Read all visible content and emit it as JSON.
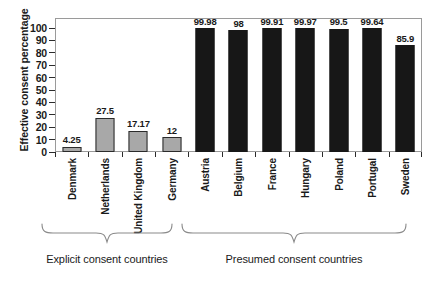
{
  "chart_data": {
    "type": "bar",
    "title": "",
    "xlabel": "",
    "ylabel": "Effective consent percentage",
    "ylim": [
      0,
      100
    ],
    "yticks": [
      0,
      10,
      20,
      30,
      40,
      50,
      60,
      70,
      80,
      90,
      100
    ],
    "grid": false,
    "legend": "none",
    "categories": [
      "Denmark",
      "Netherlands",
      "United Kingdom",
      "Germany",
      "Austria",
      "Belgium",
      "France",
      "Hungary",
      "Poland",
      "Portugal",
      "Sweden"
    ],
    "values": [
      4.25,
      27.5,
      17.17,
      12,
      99.98,
      98,
      99.91,
      99.97,
      99.5,
      99.64,
      85.9
    ],
    "value_labels": [
      "4.25",
      "27.5",
      "17.17",
      "12",
      "99.98",
      "98",
      "99.91",
      "99.97",
      "99.5",
      "99.64",
      "85.9"
    ],
    "bars": [
      {
        "category": "Denmark",
        "value": 4.25,
        "label": "4.25",
        "group": "explicit",
        "color": "#a8a8a8"
      },
      {
        "category": "Netherlands",
        "value": 27.5,
        "label": "27.5",
        "group": "explicit",
        "color": "#a8a8a8"
      },
      {
        "category": "United Kingdom",
        "value": 17.17,
        "label": "17.17",
        "group": "explicit",
        "color": "#a8a8a8"
      },
      {
        "category": "Germany",
        "value": 12,
        "label": "12",
        "group": "explicit",
        "color": "#a8a8a8"
      },
      {
        "category": "Austria",
        "value": 99.98,
        "label": "99.98",
        "group": "presumed",
        "color": "#171717"
      },
      {
        "category": "Belgium",
        "value": 98,
        "label": "98",
        "group": "presumed",
        "color": "#171717"
      },
      {
        "category": "France",
        "value": 99.91,
        "label": "99.91",
        "group": "presumed",
        "color": "#171717"
      },
      {
        "category": "Hungary",
        "value": 99.97,
        "label": "99.97",
        "group": "presumed",
        "color": "#171717"
      },
      {
        "category": "Poland",
        "value": 99.5,
        "label": "99.5",
        "group": "presumed",
        "color": "#171717"
      },
      {
        "category": "Portugal",
        "value": 99.64,
        "label": "99.64",
        "group": "presumed",
        "color": "#171717"
      },
      {
        "category": "Sweden",
        "value": 85.9,
        "label": "85.9",
        "group": "presumed",
        "color": "#171717"
      }
    ],
    "groups": [
      {
        "name": "explicit",
        "label": "Explicit consent countries",
        "members": [
          "Denmark",
          "Netherlands",
          "United Kingdom",
          "Germany"
        ]
      },
      {
        "name": "presumed",
        "label": "Presumed consent countries",
        "members": [
          "Austria",
          "Belgium",
          "France",
          "Hungary",
          "Poland",
          "Portugal",
          "Sweden"
        ]
      }
    ]
  },
  "axis": {
    "y_title": "Effective consent percentage",
    "y_tick_labels": [
      "100",
      "90",
      "80",
      "70",
      "60",
      "50",
      "40",
      "30",
      "20",
      "10",
      "0"
    ]
  },
  "annotations": {
    "group_explicit_label": "Explicit consent countries",
    "group_presumed_label": "Presumed consent countries"
  },
  "colors": {
    "explicit_bar": "#a8a8a8",
    "presumed_bar": "#171717",
    "bar_outline": "#2b2b2b",
    "frame": "#9a9a9a",
    "text": "#1a1a1a",
    "background": "#ffffff"
  }
}
